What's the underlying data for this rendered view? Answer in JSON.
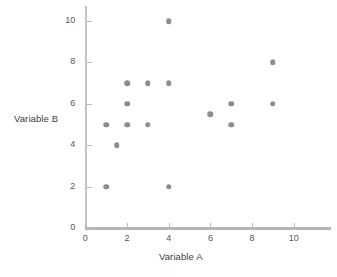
{
  "chart_data": {
    "type": "scatter",
    "title": "",
    "xlabel": "Variable A",
    "ylabel": "Variable B",
    "xlim": [
      0,
      11.8
    ],
    "ylim": [
      0,
      10.7
    ],
    "xticks": [
      0,
      2,
      4,
      6,
      8,
      10
    ],
    "yticks": [
      0,
      2,
      4,
      6,
      8,
      10
    ],
    "xtick_labels": [
      "0",
      "2",
      "4",
      "6",
      "8",
      "10"
    ],
    "ytick_labels": [
      "0",
      "2",
      "4",
      "6",
      "8",
      "10"
    ],
    "grid": false,
    "legend": false,
    "marker_color": "#8c8c91",
    "axis_color": "#bdbdbd",
    "background": "#ffffff",
    "points": [
      {
        "x": 1,
        "y": 5
      },
      {
        "x": 1,
        "y": 2
      },
      {
        "x": 1.5,
        "y": 4
      },
      {
        "x": 2,
        "y": 7
      },
      {
        "x": 2,
        "y": 6
      },
      {
        "x": 2,
        "y": 5
      },
      {
        "x": 3,
        "y": 7
      },
      {
        "x": 3,
        "y": 5
      },
      {
        "x": 4,
        "y": 10
      },
      {
        "x": 4,
        "y": 7
      },
      {
        "x": 4,
        "y": 2
      },
      {
        "x": 6,
        "y": 5.5
      },
      {
        "x": 7,
        "y": 6
      },
      {
        "x": 7,
        "y": 5
      },
      {
        "x": 9,
        "y": 8
      },
      {
        "x": 9,
        "y": 6
      }
    ]
  },
  "axes": {
    "x_title": "Variable A",
    "y_title": "Variable B"
  }
}
